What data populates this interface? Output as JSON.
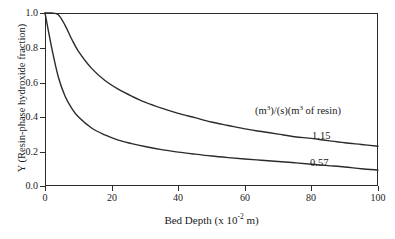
{
  "chart_data": {
    "type": "line",
    "title": "",
    "xlabel": "Bed Depth (x 10⁻² m)",
    "ylabel": "Y (Resin-phase hydroxide fraction)",
    "xlim": [
      0,
      100
    ],
    "ylim": [
      0.0,
      1.0
    ],
    "xticks": [
      0,
      20,
      40,
      60,
      80,
      100
    ],
    "yticks": [
      0.0,
      0.2,
      0.4,
      0.6,
      0.8,
      1.0
    ],
    "xtick_labels": [
      "0",
      "20",
      "40",
      "60",
      "80",
      "100"
    ],
    "ytick_labels": [
      "0.0",
      "0.2",
      "0.4",
      "0.6",
      "0.8",
      "1.0"
    ],
    "grid": false,
    "legend_position": "inside-upper-right",
    "legend_header": "(m³)/(s)(m³ of resin)",
    "line_color": "#2b2b2b",
    "x": [
      0,
      2,
      4,
      6,
      8,
      10,
      14,
      18,
      22,
      26,
      30,
      35,
      40,
      45,
      50,
      55,
      60,
      65,
      70,
      75,
      80,
      85,
      90,
      95,
      100
    ],
    "series": [
      {
        "name": "1.15",
        "label": "1.15",
        "values": [
          1.0,
          1.0,
          0.99,
          0.93,
          0.85,
          0.78,
          0.68,
          0.61,
          0.56,
          0.52,
          0.485,
          0.45,
          0.42,
          0.395,
          0.37,
          0.35,
          0.33,
          0.315,
          0.3,
          0.285,
          0.275,
          0.262,
          0.25,
          0.24,
          0.23
        ]
      },
      {
        "name": "0.57",
        "label": "0.57",
        "values": [
          1.0,
          0.8,
          0.63,
          0.52,
          0.45,
          0.4,
          0.335,
          0.295,
          0.265,
          0.245,
          0.228,
          0.21,
          0.196,
          0.184,
          0.173,
          0.164,
          0.156,
          0.149,
          0.142,
          0.134,
          0.126,
          0.118,
          0.11,
          0.1,
          0.092
        ]
      }
    ]
  },
  "axis": {
    "ylabel_text": "Y (Resin-phase hydroxide fraction)",
    "xlabel_prefix": "Bed Depth (x 10",
    "xlabel_exponent": "-2",
    "xlabel_suffix": " m)"
  },
  "legend": {
    "header_prefix": "(m",
    "header_sup1": "3",
    "header_mid": ")/(s)(m",
    "header_sup2": "3",
    "header_suffix": " of resin)"
  }
}
